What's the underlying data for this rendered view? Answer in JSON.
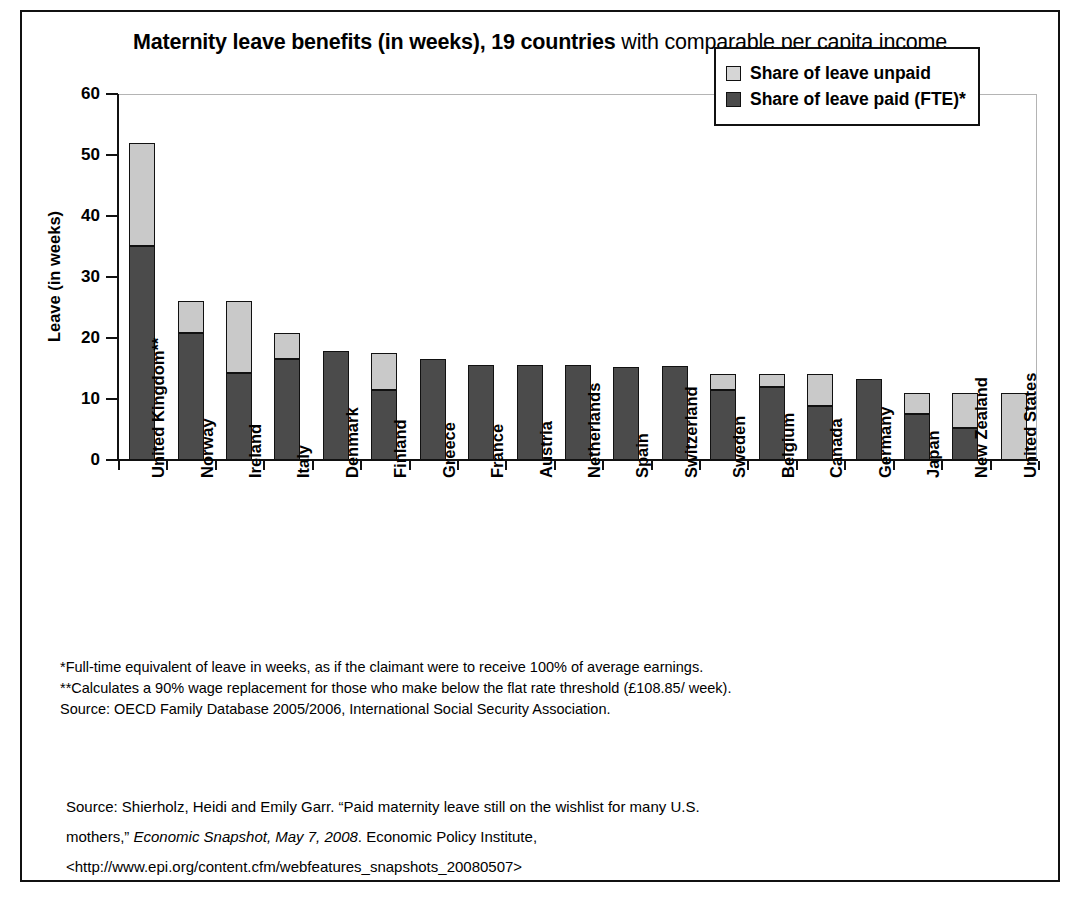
{
  "title": {
    "bold_part": "Maternity leave benefits (in weeks), 19 countries",
    "regular_part": " with comparable per capita income"
  },
  "legend": {
    "position": "top-right",
    "items": [
      {
        "label": "Share of leave unpaid",
        "color": "#c9c9c9",
        "key": "unpaid"
      },
      {
        "label": "Share of leave paid (FTE)*",
        "color": "#4b4b4b",
        "key": "paid"
      }
    ]
  },
  "notes": [
    "*Full-time equivalent of leave in weeks, as if the claimant were to receive 100% of average earnings.",
    "**Calculates a 90% wage replacement for those who make below the flat rate threshold (£108.85/ week).",
    "Source: OECD Family Database 2005/2006, International Social Security Association."
  ],
  "citation": {
    "line1_a": "Source: Shierholz, Heidi and Emily Garr. “Paid maternity leave still on the wishlist for many U.S.",
    "line2_a": "mothers,” ",
    "line2_italic": "Economic Snapshot, May 7, 2008",
    "line2_b": ". Economic Policy Institute,",
    "line3": "<http://www.epi.org/content.cfm/webfeatures_snapshots_20080507>"
  },
  "chart_data": {
    "type": "bar",
    "subtype": "stacked-column",
    "title": "Maternity leave benefits (in weeks), 19 countries with comparable per capita income",
    "xlabel": "",
    "ylabel": "Leave (in weeks)",
    "ylim": [
      0,
      60
    ],
    "yticks": [
      0,
      10,
      20,
      30,
      40,
      50,
      60
    ],
    "grid": false,
    "legend_position": "top-right",
    "categories": [
      "United Kingdom**",
      "Norway",
      "Ireland",
      "Italy",
      "Denmark",
      "Finland",
      "Greece",
      "France",
      "Austria",
      "Netherlands",
      "Spain",
      "Switzerland",
      "Sweden",
      "Belgium",
      "Canada",
      "Germany",
      "Japan",
      "New Zealand",
      "United States"
    ],
    "series": [
      {
        "name": "Share of leave paid (FTE)*",
        "color": "#4b4b4b",
        "values": [
          35.0,
          20.8,
          14.3,
          16.6,
          17.8,
          11.4,
          16.5,
          15.5,
          15.5,
          15.5,
          15.3,
          15.4,
          11.4,
          12.0,
          8.8,
          13.2,
          7.5,
          5.3,
          0.0
        ]
      },
      {
        "name": "Share of leave unpaid",
        "color": "#c9c9c9",
        "values": [
          17.0,
          5.2,
          11.7,
          4.2,
          0.0,
          6.1,
          0.0,
          0.0,
          0.0,
          0.0,
          0.0,
          0.0,
          2.7,
          2.1,
          5.3,
          0.0,
          3.5,
          5.7,
          11.0
        ]
      }
    ],
    "totals": [
      52.0,
      26.0,
      26.0,
      20.8,
      17.8,
      17.5,
      16.5,
      15.5,
      15.5,
      15.5,
      15.3,
      15.4,
      14.1,
      14.1,
      14.1,
      13.2,
      11.0,
      11.0,
      11.0
    ]
  }
}
